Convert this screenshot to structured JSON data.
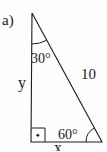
{
  "figure": {
    "item_label": "a)",
    "triangle": {
      "apex_angle_label": "30°",
      "base_angle_label": "60°",
      "hypotenuse_label": "10",
      "left_side_label": "y",
      "bottom_side_label": "x",
      "right_angle_marker": "square-with-dot"
    },
    "colors": {
      "line": "#1c1c1c",
      "text": "#1c1c1c",
      "background": "#fdfdfd"
    }
  }
}
